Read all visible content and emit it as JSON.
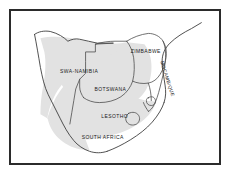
{
  "figure": {
    "kind": "thematic-map",
    "region": "Southern Africa",
    "frame_color": "#2b2b2b",
    "background_color": "#ffffff",
    "coast_line_color": "#3a3a3a",
    "border_line_color": "#555555",
    "shading_color": "#e0e0e0",
    "shading_color_dark": "#d2d2d2"
  },
  "labels": {
    "namibia": "SWA-NAMIBIA",
    "botswana": "BOTSWANA",
    "zimbabwe": "ZIMBABWE",
    "mozambique": "MOCAMBIQUE",
    "lesotho": "LESOTHO",
    "south_africa": "SOUTH AFRICA"
  }
}
